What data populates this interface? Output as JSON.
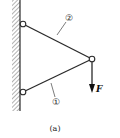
{
  "figure": {
    "caption": "(a)",
    "members": [
      {
        "id": "member-1",
        "label": "①"
      },
      {
        "id": "member-2",
        "label": "②"
      }
    ],
    "force": {
      "label": "F",
      "direction": "down"
    },
    "support": {
      "type": "fixed wall",
      "side": "left"
    },
    "colors": {
      "line": "#2a2a2a",
      "hatch": "#555555",
      "background": "#ffffff"
    }
  }
}
